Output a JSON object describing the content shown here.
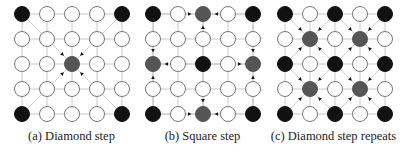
{
  "figure": {
    "panels": [
      {
        "id": "a",
        "caption": "(a) Diamond step",
        "origin_x": 22,
        "nodes": [
          [
            "black",
            "white",
            "white",
            "white",
            "black"
          ],
          [
            "white",
            "white",
            "white",
            "white",
            "white"
          ],
          [
            "white",
            "white",
            "gray",
            "white",
            "white"
          ],
          [
            "white",
            "white",
            "white",
            "white",
            "white"
          ],
          [
            "black",
            "white",
            "white",
            "white",
            "black"
          ]
        ],
        "arrows": [
          {
            "from": [
              0,
              0
            ],
            "to": [
              2,
              2
            ]
          },
          {
            "from": [
              0,
              4
            ],
            "to": [
              2,
              2
            ]
          },
          {
            "from": [
              4,
              0
            ],
            "to": [
              2,
              2
            ]
          },
          {
            "from": [
              4,
              4
            ],
            "to": [
              2,
              2
            ]
          }
        ]
      },
      {
        "id": "b",
        "caption": "(b) Square step",
        "origin_x": 153,
        "nodes": [
          [
            "black",
            "white",
            "gray",
            "white",
            "black"
          ],
          [
            "white",
            "white",
            "white",
            "white",
            "white"
          ],
          [
            "gray",
            "white",
            "black",
            "white",
            "gray"
          ],
          [
            "white",
            "white",
            "white",
            "white",
            "white"
          ],
          [
            "black",
            "white",
            "gray",
            "white",
            "black"
          ]
        ],
        "arrows": [
          {
            "from": [
              0,
              0
            ],
            "to": [
              0,
              2
            ]
          },
          {
            "from": [
              0,
              4
            ],
            "to": [
              0,
              2
            ]
          },
          {
            "from": [
              2,
              2
            ],
            "to": [
              0,
              2
            ]
          },
          {
            "from": [
              0,
              0
            ],
            "to": [
              2,
              0
            ]
          },
          {
            "from": [
              4,
              0
            ],
            "to": [
              2,
              0
            ]
          },
          {
            "from": [
              2,
              2
            ],
            "to": [
              2,
              0
            ]
          },
          {
            "from": [
              0,
              4
            ],
            "to": [
              2,
              4
            ]
          },
          {
            "from": [
              4,
              4
            ],
            "to": [
              2,
              4
            ]
          },
          {
            "from": [
              2,
              2
            ],
            "to": [
              2,
              4
            ]
          },
          {
            "from": [
              4,
              0
            ],
            "to": [
              4,
              2
            ]
          },
          {
            "from": [
              4,
              4
            ],
            "to": [
              4,
              2
            ]
          },
          {
            "from": [
              2,
              2
            ],
            "to": [
              4,
              2
            ]
          }
        ]
      },
      {
        "id": "c",
        "caption": "(c) Diamond step repeats",
        "origin_x": 285,
        "nodes": [
          [
            "black",
            "white",
            "black",
            "white",
            "black"
          ],
          [
            "white",
            "gray",
            "white",
            "gray",
            "white"
          ],
          [
            "black",
            "white",
            "black",
            "white",
            "black"
          ],
          [
            "white",
            "gray",
            "white",
            "gray",
            "white"
          ],
          [
            "black",
            "white",
            "black",
            "white",
            "black"
          ]
        ],
        "arrows": [
          {
            "from": [
              0,
              0
            ],
            "to": [
              1,
              1
            ]
          },
          {
            "from": [
              0,
              2
            ],
            "to": [
              1,
              1
            ]
          },
          {
            "from": [
              2,
              0
            ],
            "to": [
              1,
              1
            ]
          },
          {
            "from": [
              2,
              2
            ],
            "to": [
              1,
              1
            ]
          },
          {
            "from": [
              0,
              2
            ],
            "to": [
              1,
              3
            ]
          },
          {
            "from": [
              0,
              4
            ],
            "to": [
              1,
              3
            ]
          },
          {
            "from": [
              2,
              2
            ],
            "to": [
              1,
              3
            ]
          },
          {
            "from": [
              2,
              4
            ],
            "to": [
              1,
              3
            ]
          },
          {
            "from": [
              2,
              0
            ],
            "to": [
              3,
              1
            ]
          },
          {
            "from": [
              2,
              2
            ],
            "to": [
              3,
              1
            ]
          },
          {
            "from": [
              4,
              0
            ],
            "to": [
              3,
              1
            ]
          },
          {
            "from": [
              4,
              2
            ],
            "to": [
              3,
              1
            ]
          },
          {
            "from": [
              2,
              2
            ],
            "to": [
              3,
              3
            ]
          },
          {
            "from": [
              2,
              4
            ],
            "to": [
              3,
              3
            ]
          },
          {
            "from": [
              4,
              2
            ],
            "to": [
              3,
              3
            ]
          },
          {
            "from": [
              4,
              4
            ],
            "to": [
              3,
              3
            ]
          }
        ]
      }
    ],
    "colors": {
      "black": "#111111",
      "gray": "#555555",
      "white": "#ffffff",
      "stroke": "#777777",
      "grid": "#c8c8c8",
      "diag": "#d4d4d4",
      "arrowhead": "#111111"
    },
    "grid": {
      "rows": 5,
      "cols": 5,
      "spacing": 25,
      "origin_y": 14,
      "radius": 7.5
    }
  }
}
